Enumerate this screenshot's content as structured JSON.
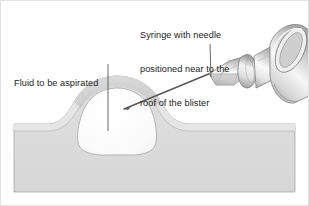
{
  "figure": {
    "background_color": "#ffffff",
    "frame_color": "#e2e2e2",
    "width": 309,
    "height": 206
  },
  "labels": {
    "syringe": {
      "line1": "Syringe with needle",
      "line2": "positioned near to the",
      "line3": "roof of the blister"
    },
    "fluid": {
      "line1": "Fluid to be aspirated"
    }
  },
  "anatomy": {
    "blister_fluid_name": "blister fluid cavity",
    "blister_roof_name": "blister roof",
    "epidermis_name": "epidermis layer",
    "dermis_name": "dermis layer"
  },
  "instrument": {
    "barrel_name": "syringe barrel",
    "collar_name": "luer lock collar",
    "hub_name": "needle hub",
    "needle_name": "needle shaft"
  },
  "colors": {
    "skin_fill": "#dcdcdc",
    "skin_fill_light": "#e8e8e8",
    "blister_roof": "#d2d2d2",
    "fluid_fill": "#fbfbfb",
    "outline": "#8a8a8a",
    "outline_soft": "#aaaaaa",
    "syringe_light": "#f2f2f2",
    "syringe_mid": "#cfcfcf",
    "syringe_dark": "#9a9a9a",
    "needle": "#6f6f6f",
    "leader_line": "#555555",
    "text": "#1b1b1b"
  }
}
